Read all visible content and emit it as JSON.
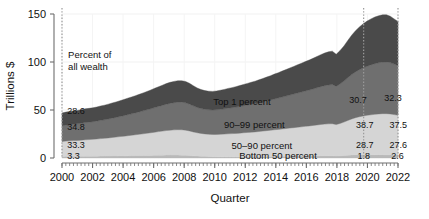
{
  "chart_data": {
    "type": "area",
    "title": "",
    "xlabel": "Quarter",
    "ylabel": "Trillions $",
    "stacked": true,
    "grid": true,
    "legend_position": "inline-labels",
    "xlim": [
      2000,
      2022
    ],
    "ylim": [
      0,
      150
    ],
    "yticks": [
      0,
      50,
      100,
      150
    ],
    "ytick_labels": [
      "0",
      "50",
      "100",
      "150"
    ],
    "xticks": [
      2000,
      2002,
      2004,
      2006,
      2008,
      2010,
      2012,
      2014,
      2016,
      2018,
      2020,
      2022
    ],
    "xtick_labels": [
      "2000",
      "2002",
      "2004",
      "2006",
      "2008",
      "2010",
      "2012",
      "2014",
      "2016",
      "2018",
      "2020",
      "2022"
    ],
    "minor_xtick_interval_years": 0.25,
    "annotations": [
      {
        "name": "percent-of-all-wealth",
        "line1": "Percent of",
        "line2": "all wealth",
        "x": 2000.4,
        "y": 104
      },
      {
        "name": "vline-2019q4",
        "type": "vline",
        "x": 2019.75,
        "style": "dotted"
      },
      {
        "name": "vline-2022",
        "type": "vline",
        "x": 2022.0,
        "style": "dotted"
      },
      {
        "name": "vline-2000",
        "type": "vline",
        "x": 2000.0,
        "style": "dotted"
      }
    ],
    "series": [
      {
        "name": "Bottom 50 percent",
        "label": "Bottom 50 percent",
        "color": "#b9b9b9",
        "label_x": 2011.6,
        "label_y": 1.6,
        "pct_labels": [
          {
            "text": "3.3",
            "x": 2000.35,
            "y": 2.0
          },
          {
            "text": "1.8",
            "x": 2019.35,
            "y": 2.0
          },
          {
            "text": "2.6",
            "x": 2021.55,
            "y": 2.0
          }
        ],
        "values": [
          1.6,
          1.7,
          1.7,
          1.7,
          1.7,
          1.7,
          1.8,
          1.8,
          1.9,
          1.9,
          2.0,
          2.0,
          2.1,
          2.2,
          2.2,
          2.3,
          2.3,
          2.4,
          2.5,
          2.5,
          2.6,
          2.6,
          2.7,
          2.7,
          2.8,
          2.9,
          2.9,
          3.0,
          3.0,
          3.0,
          3.0,
          2.9,
          2.8,
          2.6,
          2.3,
          2.1,
          1.9,
          1.7,
          1.5,
          1.4,
          1.3,
          1.3,
          1.3,
          1.3,
          1.3,
          1.3,
          1.3,
          1.4,
          1.4,
          1.4,
          1.4,
          1.5,
          1.5,
          1.6,
          1.6,
          1.7,
          1.7,
          1.8,
          1.8,
          1.9,
          1.9,
          2.0,
          2.0,
          2.1,
          2.1,
          2.2,
          2.2,
          2.3,
          2.3,
          2.3,
          2.3,
          2.2,
          2.4,
          2.6,
          2.9,
          3.2,
          3.4,
          3.5,
          3.5,
          3.5,
          3.4,
          3.4,
          3.4,
          3.4,
          3.3,
          3.3,
          3.3,
          3.4
        ]
      },
      {
        "name": "50–90 percent",
        "label": "50–90 percent",
        "color": "#d5d5d5",
        "label_x": 2011.1,
        "label_y": 12,
        "pct_labels": [
          {
            "text": "33.3",
            "x": 2000.35,
            "y": 13.5
          },
          {
            "text": "28.7",
            "x": 2019.25,
            "y": 13.5
          },
          {
            "text": "27.6",
            "x": 2021.45,
            "y": 13.5
          }
        ],
        "values": [
          15.6,
          15.9,
          16.2,
          16.4,
          16.6,
          16.9,
          17.2,
          17.4,
          17.6,
          17.9,
          18.2,
          18.5,
          18.8,
          19.2,
          19.6,
          20.0,
          20.4,
          20.8,
          21.2,
          21.7,
          22.1,
          22.6,
          23.1,
          23.6,
          24.1,
          24.6,
          25.1,
          25.6,
          26.0,
          26.3,
          26.5,
          26.5,
          26.2,
          25.6,
          24.9,
          24.2,
          23.7,
          23.4,
          23.2,
          23.1,
          23.2,
          23.4,
          23.6,
          23.9,
          24.1,
          24.3,
          24.6,
          24.9,
          25.2,
          25.5,
          25.8,
          26.1,
          26.5,
          26.9,
          27.3,
          27.7,
          28.1,
          28.5,
          28.9,
          29.3,
          29.7,
          30.1,
          30.5,
          30.9,
          31.3,
          31.7,
          32.2,
          32.6,
          33.0,
          33.3,
          33.4,
          32.6,
          33.6,
          34.8,
          36.2,
          37.5,
          38.6,
          39.5,
          40.3,
          41.0,
          41.6,
          42.1,
          42.5,
          42.8,
          42.9,
          42.6,
          41.9,
          41.2
        ]
      },
      {
        "name": "90–99 percent",
        "label": "90–99 percent",
        "color": "#6f6f6f",
        "label_x": 2010.6,
        "label_y": 34,
        "pct_labels": [
          {
            "text": "34.8",
            "x": 2000.35,
            "y": 32
          },
          {
            "text": "38.7",
            "x": 2019.25,
            "y": 34
          },
          {
            "text": "37.5",
            "x": 2021.45,
            "y": 34
          }
        ],
        "values": [
          16.3,
          16.6,
          16.9,
          17.1,
          17.3,
          17.6,
          17.9,
          18.1,
          18.3,
          18.6,
          19.0,
          19.3,
          19.7,
          20.1,
          20.5,
          20.9,
          21.4,
          21.9,
          22.3,
          22.8,
          23.3,
          23.9,
          24.4,
          25.0,
          25.6,
          26.2,
          26.8,
          27.4,
          27.9,
          28.3,
          28.6,
          28.7,
          28.5,
          27.9,
          27.1,
          26.4,
          25.9,
          25.6,
          25.5,
          25.5,
          25.7,
          26.0,
          26.3,
          26.7,
          27.0,
          27.4,
          27.8,
          28.2,
          28.6,
          29.1,
          29.5,
          30.0,
          30.5,
          31.0,
          31.5,
          32.1,
          32.6,
          33.2,
          33.8,
          34.4,
          35.0,
          35.6,
          36.2,
          36.8,
          37.4,
          38.0,
          38.7,
          39.4,
          40.0,
          40.5,
          40.8,
          39.8,
          41.1,
          42.7,
          44.5,
          46.2,
          47.7,
          49.0,
          50.1,
          51.1,
          52.0,
          52.7,
          53.3,
          53.7,
          53.9,
          53.5,
          52.6,
          51.6
        ]
      },
      {
        "name": "Top 1 percent",
        "label": "Top 1 percent",
        "color": "#4a4a4a",
        "label_x": 2009.9,
        "label_y": 58,
        "pct_labels": [
          {
            "text": "28.6",
            "x": 2000.35,
            "y": 49
          },
          {
            "text": "30.7",
            "x": 2018.8,
            "y": 60
          },
          {
            "text": "32.3",
            "x": 2021.1,
            "y": 62
          }
        ],
        "values": [
          13.4,
          13.6,
          13.7,
          13.8,
          13.9,
          14.1,
          14.3,
          14.4,
          14.5,
          14.7,
          15.0,
          15.2,
          15.5,
          15.8,
          16.1,
          16.4,
          16.8,
          17.2,
          17.5,
          17.9,
          18.3,
          18.7,
          19.1,
          19.6,
          20.1,
          20.5,
          21.0,
          21.5,
          21.9,
          22.2,
          22.4,
          22.4,
          22.2,
          21.7,
          21.0,
          20.3,
          19.8,
          19.5,
          19.4,
          19.4,
          19.6,
          19.9,
          20.2,
          20.6,
          20.9,
          21.3,
          21.7,
          22.1,
          22.5,
          22.9,
          23.3,
          23.8,
          24.3,
          24.8,
          25.3,
          25.9,
          26.4,
          27.0,
          27.6,
          28.2,
          28.8,
          29.4,
          30.0,
          30.6,
          31.2,
          31.9,
          32.6,
          33.3,
          34.0,
          34.5,
          34.8,
          33.4,
          34.8,
          36.6,
          38.8,
          41.0,
          42.9,
          44.5,
          45.9,
          47.0,
          47.9,
          48.6,
          49.0,
          49.2,
          49.1,
          48.3,
          47.1,
          46.0
        ]
      }
    ]
  }
}
